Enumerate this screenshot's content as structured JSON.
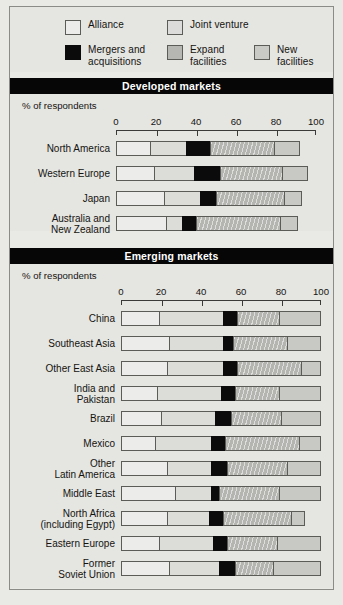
{
  "legend": {
    "items": [
      {
        "id": "alliance",
        "label": "Alliance",
        "color": "#ececea"
      },
      {
        "id": "jv",
        "label": "Joint venture",
        "color": "#dcdcd9"
      },
      {
        "id": "ma",
        "label": "Mergers and\nacquisitions",
        "color": "#0b0b0b"
      },
      {
        "id": "expand",
        "label": "Expand\nfacilities",
        "color": "#b4b4b0"
      },
      {
        "id": "new",
        "label": "New\nfacilities",
        "color": "#c8c8c5"
      }
    ]
  },
  "sections": [
    {
      "id": "developed",
      "title": "Developed markets",
      "axis_title": "% of respondents",
      "ticks": [
        "0",
        "20",
        "40",
        "60",
        "80",
        "100"
      ]
    },
    {
      "id": "emerging",
      "title": "Emerging markets",
      "axis_title": "% of respondents",
      "ticks": [
        "0",
        "20",
        "40",
        "60",
        "80",
        "100"
      ]
    }
  ],
  "chart_data": {
    "type": "bar",
    "orientation": "horizontal",
    "stacked": true,
    "title": "",
    "xlabel": "% of respondents",
    "ylabel": "",
    "xlim": [
      0,
      100
    ],
    "xticks": [
      0,
      20,
      40,
      60,
      80,
      100
    ],
    "grid": false,
    "legend_position": "top",
    "series": [
      {
        "name": "Alliance",
        "key": "alliance",
        "color": "#ececea"
      },
      {
        "name": "Joint venture",
        "key": "jv",
        "color": "#dcdcd9"
      },
      {
        "name": "Mergers and acquisitions",
        "key": "ma",
        "color": "#0b0b0b"
      },
      {
        "name": "Expand facilities",
        "key": "expand",
        "color": "#b4b4b0"
      },
      {
        "name": "New facilities",
        "key": "new",
        "color": "#c8c8c5"
      }
    ],
    "panels": [
      {
        "panel": "Developed markets",
        "categories": [
          "North America",
          "Western Europe",
          "Japan",
          "Australia and\nNew Zealand"
        ],
        "values": {
          "alliance": [
            17,
            19,
            24,
            25
          ],
          "jv": [
            18,
            20,
            18,
            8
          ],
          "ma": [
            12,
            13,
            8,
            7
          ],
          "expand": [
            32,
            31,
            34,
            42
          ],
          "new": [
            13,
            13,
            9,
            9
          ]
        }
      },
      {
        "panel": "Emerging markets",
        "categories": [
          "China",
          "Southeast Asia",
          "Other East Asia",
          "India and\nPakistan",
          "Brazil",
          "Mexico",
          "Other\nLatin America",
          "Middle East",
          "North Africa\n(including Egypt)",
          "Eastern Europe",
          "Former\nSoviet Union"
        ],
        "values": {
          "alliance": [
            19,
            24,
            23,
            18,
            20,
            17,
            23,
            27,
            23,
            19,
            24
          ],
          "jv": [
            32,
            27,
            28,
            32,
            27,
            28,
            22,
            18,
            21,
            27,
            25
          ],
          "ma": [
            7,
            5,
            7,
            7,
            8,
            7,
            8,
            4,
            7,
            7,
            8
          ],
          "expand": [
            21,
            27,
            32,
            22,
            25,
            37,
            30,
            30,
            34,
            25,
            19
          ],
          "new": [
            21,
            17,
            10,
            21,
            20,
            11,
            17,
            21,
            7,
            22,
            24
          ]
        }
      }
    ]
  }
}
